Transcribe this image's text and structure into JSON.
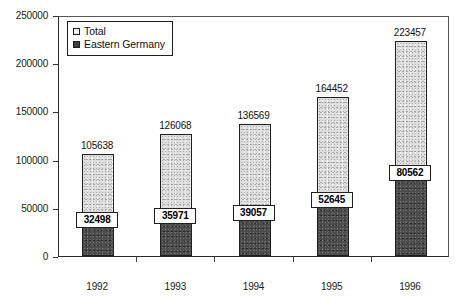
{
  "chart_data": {
    "type": "bar",
    "subtype": "stacked-bar",
    "title": "",
    "xlabel": "",
    "ylabel": "",
    "categories": [
      "1992",
      "1993",
      "1994",
      "1995",
      "1996"
    ],
    "series": [
      {
        "name": "Total",
        "values": [
          105638,
          126068,
          136569,
          164452,
          223457
        ],
        "color": "#dedede",
        "fill": "light-speckle"
      },
      {
        "name": "Eastern Germany",
        "values": [
          32498,
          35971,
          39057,
          52645,
          80562
        ],
        "color": "#4b4b4b",
        "fill": "dark-speckle"
      }
    ],
    "ylim": [
      0,
      250000
    ],
    "ytick_values": [
      0,
      50000,
      100000,
      150000,
      200000,
      250000
    ],
    "ytick_labels": [
      "0",
      "50000",
      "100000",
      "150000",
      "200000",
      "250000"
    ],
    "grid": false,
    "legend_position": "top-left",
    "legend_entries": [
      "Total",
      "Eastern Germany"
    ],
    "total_labels": [
      "105638",
      "126068",
      "136569",
      "164452",
      "223457"
    ],
    "eastern_labels": [
      "32498",
      "35971",
      "39057",
      "52645",
      "80562"
    ]
  },
  "legend": {
    "items": [
      {
        "label": "Total",
        "swatch": "light-square-swatch"
      },
      {
        "label": "Eastern Germany",
        "swatch": "dark-square-swatch"
      }
    ]
  }
}
